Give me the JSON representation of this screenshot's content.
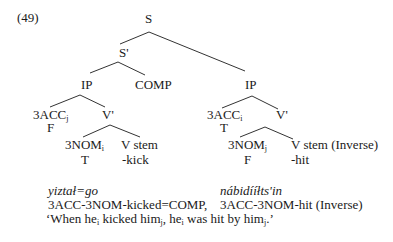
{
  "example_number": "(49)",
  "tree": {
    "root": "S",
    "s_bar": "S'",
    "left_ip": {
      "label": "IP",
      "spec": {
        "label": "3ACC",
        "index": "j",
        "feature": "F"
      },
      "v_bar": {
        "label": "V'",
        "subject": {
          "label": "3NOM",
          "index": "i",
          "feature": "T"
        },
        "verb": {
          "label": "V stem",
          "gloss": "-kick"
        }
      }
    },
    "comp": "COMP",
    "right_ip": {
      "label": "IP",
      "spec": {
        "label": "3ACC",
        "index": "i",
        "feature": "T"
      },
      "v_bar": {
        "label": "V'",
        "subject": {
          "label": "3NOM",
          "index": "j",
          "feature": "F"
        },
        "verb": {
          "label": "V stem (Inverse)",
          "gloss": "-hit"
        }
      }
    }
  },
  "gloss": {
    "left_word": "yiztał=go",
    "right_word": "nábidííłts'in",
    "left_morph": "3ACC-3NOM-kicked=COMP,",
    "right_morph": "3ACC-3NOM-hit (Inverse)",
    "translation": {
      "p1": "‘When he",
      "i1": "i",
      "p2": " kicked him",
      "i2": "j",
      "p3": ", he",
      "i3": "i",
      "p4": " was hit by him",
      "i4": "j",
      "p5": ".’"
    }
  }
}
